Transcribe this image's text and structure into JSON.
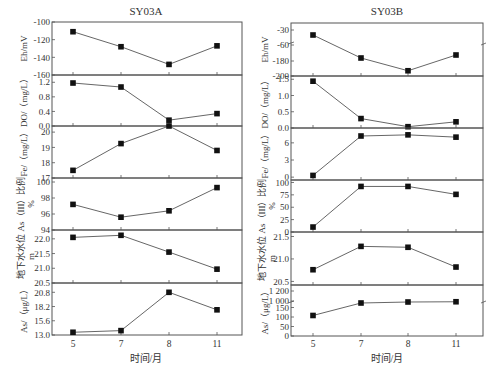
{
  "chart_data": [
    {
      "type": "line",
      "title": "SY03A",
      "xlabel": "时间/月",
      "categories": [
        "5",
        "7",
        "8",
        "11"
      ],
      "panels": [
        {
          "ylabel": "Eh/mV",
          "ylim": [
            -160,
            -100
          ],
          "yticks": [
            -100,
            -120,
            -140,
            -160
          ],
          "values": [
            -111,
            -128,
            -148,
            -127
          ]
        },
        {
          "ylabel": "DO/（mg/L）",
          "ylim": [
            0.0,
            1.4
          ],
          "yticks": [
            "0.0",
            "0.4",
            "0.8",
            "1.2"
          ],
          "tickvals": [
            0.0,
            0.4,
            0.8,
            1.2
          ],
          "values": [
            1.18,
            1.07,
            0.16,
            0.34
          ]
        },
        {
          "ylabel": "Fe/（mg/L）",
          "ylim": [
            17,
            20.4
          ],
          "yticks": [
            17,
            18,
            19,
            20
          ],
          "values": [
            17.5,
            19.25,
            20.4,
            18.8
          ]
        },
        {
          "ylabel": "As（III）比例/%",
          "ylim": [
            94,
            100.5
          ],
          "yticks": [
            94,
            96,
            98,
            100
          ],
          "values": [
            97.2,
            95.6,
            96.4,
            99.3
          ]
        },
        {
          "ylabel": "地下水水位/m",
          "ylim": [
            20.5,
            22.3
          ],
          "yticks": [
            "20.5",
            "21.0",
            "21.5",
            "22.0"
          ],
          "tickvals": [
            20.5,
            21.0,
            21.5,
            22.0
          ],
          "values": [
            22.05,
            22.12,
            21.55,
            20.97
          ]
        },
        {
          "ylabel": "As/（μg/L）",
          "ylim": [
            13.0,
            22.5
          ],
          "yticks": [
            "13.0",
            "15.6",
            "18.2",
            "20.8"
          ],
          "tickvals": [
            13.0,
            15.6,
            18.2,
            20.8
          ],
          "values": [
            13.5,
            13.8,
            20.8,
            17.6
          ]
        }
      ]
    },
    {
      "type": "line",
      "title": "SY03B",
      "xlabel": "时间/月",
      "categories": [
        "5",
        "7",
        "8",
        "11"
      ],
      "panels": [
        {
          "ylabel": "Eh/mV",
          "broken_axis": true,
          "yticks": [
            "-30",
            "-60",
            "-180",
            "-200"
          ],
          "values": [
            -40,
            -176,
            -193,
            -172
          ]
        },
        {
          "ylabel": "DO/（mg/L）",
          "ylim": [
            0.0,
            1.6
          ],
          "yticks": [
            "0.0",
            "0.5",
            "1.0",
            "1.5"
          ],
          "tickvals": [
            0.0,
            0.5,
            1.0,
            1.5
          ],
          "values": [
            1.44,
            0.29,
            0.04,
            0.19
          ]
        },
        {
          "ylabel": "Fe/（mg/L）",
          "ylim": [
            -0.5,
            8.6
          ],
          "yticks": [
            0,
            3,
            6
          ],
          "values": [
            0.3,
            7.2,
            7.4,
            7.0
          ]
        },
        {
          "ylabel": "As（III）比例/%",
          "ylim": [
            0,
            105
          ],
          "yticks": [
            0,
            25,
            50,
            75,
            100
          ],
          "values": [
            10,
            92,
            92,
            76
          ]
        },
        {
          "ylabel": "地下水水位/m",
          "ylim": [
            20.42,
            21.6
          ],
          "yticks": [
            "20.5",
            "21.0",
            "21.5"
          ],
          "tickvals": [
            20.5,
            21.0,
            21.5
          ],
          "values": [
            20.76,
            21.28,
            21.26,
            20.82
          ]
        },
        {
          "ylabel": "As/（μg/L）",
          "broken_axis": true,
          "yticks": [
            "0",
            "50",
            "100",
            "150",
            "1 000",
            "1 200"
          ],
          "values": [
            108,
            960,
            980,
            985
          ]
        }
      ]
    }
  ]
}
